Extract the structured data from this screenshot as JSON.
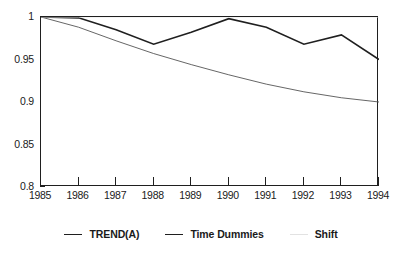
{
  "chart_data": {
    "type": "line",
    "title": "",
    "subtitle": "",
    "xlabel": "",
    "ylabel": "",
    "grid": false,
    "legend_position": "bottom",
    "x": [
      1985,
      1986,
      1987,
      1988,
      1989,
      1990,
      1991,
      1992,
      1993,
      1994
    ],
    "categories": [
      "1985",
      "1986",
      "1987",
      "1988",
      "1989",
      "1990",
      "1991",
      "1992",
      "1993",
      "1994"
    ],
    "xlim": [
      1985,
      1994
    ],
    "ylim": [
      0.8,
      1.0
    ],
    "yticks": [
      0.8,
      0.85,
      0.9,
      0.95,
      1.0
    ],
    "ytick_labels": [
      "0.8",
      "0.85",
      "0.9",
      "0.95",
      "1"
    ],
    "xticks": [
      1985,
      1986,
      1987,
      1988,
      1989,
      1990,
      1991,
      1992,
      1993,
      1994
    ],
    "series": [
      {
        "name": "TREND(A)",
        "color": "#555555",
        "width": 0.9,
        "values": [
          1.0,
          0.988,
          0.972,
          0.957,
          0.944,
          0.932,
          0.921,
          0.912,
          0.905,
          0.9
        ]
      },
      {
        "name": "Time Dummies",
        "color": "#1f1f1f",
        "width": 1.6,
        "values": [
          1.0,
          0.999,
          0.985,
          0.968,
          0.982,
          0.998,
          0.988,
          0.968,
          0.979,
          0.95
        ]
      },
      {
        "name": "Shift",
        "color": "#e8e8e8",
        "width": 0.9,
        "values": [
          1.0,
          1.0,
          1.0,
          1.0,
          1.0,
          1.0,
          1.0,
          1.0,
          1.0,
          1.0
        ]
      }
    ]
  },
  "legend": {
    "items": [
      {
        "label": "TREND(A)",
        "style": "thin"
      },
      {
        "label": "Time Dummies",
        "style": "thick"
      },
      {
        "label": "Shift",
        "style": "faint"
      }
    ]
  }
}
